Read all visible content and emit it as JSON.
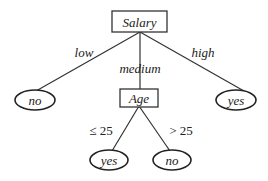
{
  "diagram": {
    "type": "decision-tree",
    "root": {
      "label": "Salary",
      "shape": "rectangle"
    },
    "edges": {
      "low": "low",
      "medium": "medium",
      "high": "high",
      "le25": "≤ 25",
      "gt25": "> 25"
    },
    "nodes": {
      "low_leaf": "no",
      "high_leaf": "yes",
      "age": "Age",
      "age_le25_leaf": "yes",
      "age_gt25_leaf": "no"
    }
  }
}
